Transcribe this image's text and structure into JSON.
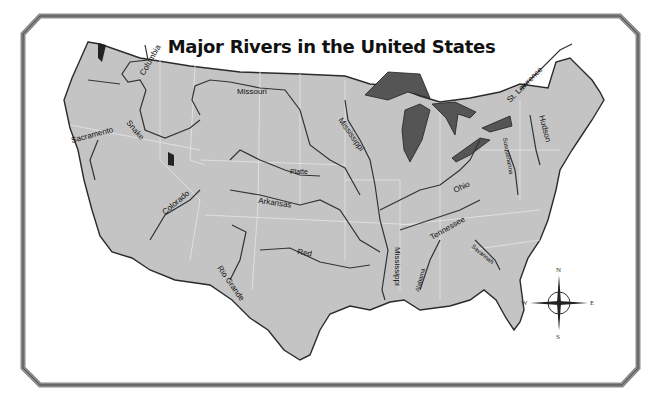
{
  "map": {
    "title": "Major Rivers in the United States",
    "colors": {
      "land": "#c4c4c4",
      "water_lakes": "#555555",
      "rivers": "#333333",
      "state_borders": "#e6e6e6",
      "frame": "#8a8a8a",
      "background": "#ffffff"
    },
    "rivers": [
      {
        "name": "Columbia"
      },
      {
        "name": "Missouri"
      },
      {
        "name": "Snake"
      },
      {
        "name": "Sacramento"
      },
      {
        "name": "Mississippi"
      },
      {
        "name": "St. Lawrence"
      },
      {
        "name": "Hudson"
      },
      {
        "name": "Susquehanna"
      },
      {
        "name": "Platte"
      },
      {
        "name": "Ohio"
      },
      {
        "name": "Colorado"
      },
      {
        "name": "Arkansas"
      },
      {
        "name": "Tennessee"
      },
      {
        "name": "Red"
      },
      {
        "name": "Mississippi"
      },
      {
        "name": "Savannah"
      },
      {
        "name": "Alabama"
      },
      {
        "name": "Rio Grande"
      }
    ],
    "compass": {
      "n": "N",
      "s": "S",
      "e": "E",
      "w": "W"
    }
  }
}
